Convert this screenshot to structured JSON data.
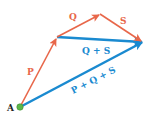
{
  "diagram": {
    "colors": {
      "orange": "#e8674a",
      "blue": "#1a8ad0",
      "point": "#5cb84a",
      "text_dark": "#222222"
    },
    "point": {
      "label": "A",
      "x": 20,
      "y": 107
    },
    "vectors": [
      {
        "id": "P",
        "label": "P",
        "color": "orange",
        "from": [
          20,
          107
        ],
        "to": [
          57,
          37
        ]
      },
      {
        "id": "Q",
        "label": "Q",
        "color": "orange",
        "from": [
          57,
          37
        ],
        "to": [
          100,
          14
        ]
      },
      {
        "id": "S",
        "label": "S",
        "color": "orange",
        "from": [
          100,
          14
        ],
        "to": [
          143,
          42
        ]
      },
      {
        "id": "QS",
        "label": "Q + S",
        "color": "blue",
        "from": [
          57,
          37
        ],
        "to": [
          143,
          42
        ]
      },
      {
        "id": "PQS",
        "label": "P + Q + S",
        "color": "blue",
        "from": [
          20,
          107
        ],
        "to": [
          143,
          42
        ]
      }
    ]
  }
}
